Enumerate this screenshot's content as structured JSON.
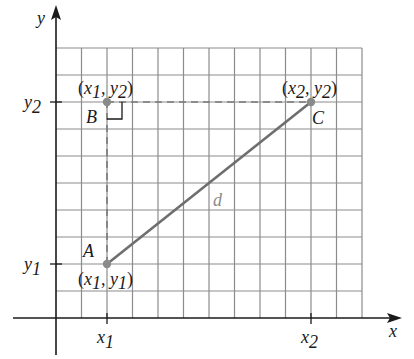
{
  "figure": {
    "axes": {
      "x_label": "x",
      "y_label": "y"
    },
    "grid": {
      "columns": 12,
      "rows": 10,
      "color": "#8c8c8c"
    },
    "ticks": {
      "x": [
        {
          "base": "x",
          "sub": "1",
          "col": 2
        },
        {
          "base": "x",
          "sub": "2",
          "col": 10
        }
      ],
      "y": [
        {
          "base": "y",
          "sub": "2",
          "row": 2
        },
        {
          "base": "y",
          "sub": "1",
          "row": 8
        }
      ]
    },
    "points": {
      "A": {
        "label": "A",
        "coord": "(x1, y1)",
        "coord_parts": [
          "(",
          "x",
          "1",
          ", ",
          "y",
          "1",
          ")"
        ],
        "col": 2,
        "row": 8
      },
      "B": {
        "label": "B",
        "coord": "(x1, y2)",
        "coord_parts": [
          "(",
          "x",
          "1",
          ", ",
          "y",
          "2",
          ")"
        ],
        "col": 2,
        "row": 2
      },
      "C": {
        "label": "C",
        "coord": "(x2, y2)",
        "coord_parts": [
          "(",
          "x",
          "2",
          ", ",
          "y",
          "2",
          ")"
        ],
        "col": 10,
        "row": 2
      }
    },
    "segment": {
      "from": "A",
      "to": "C",
      "label": "d",
      "color": "#6e6e6e"
    },
    "dashed_lines": [
      {
        "from": "A",
        "to": "B"
      },
      {
        "from": "B",
        "to": "C"
      }
    ],
    "right_angle_at": "B",
    "colors": {
      "axis": "#1a1a1a",
      "point": "#8a8a8a",
      "dashed": "#7a7a7a",
      "label_d": "#8a8a8a"
    }
  }
}
